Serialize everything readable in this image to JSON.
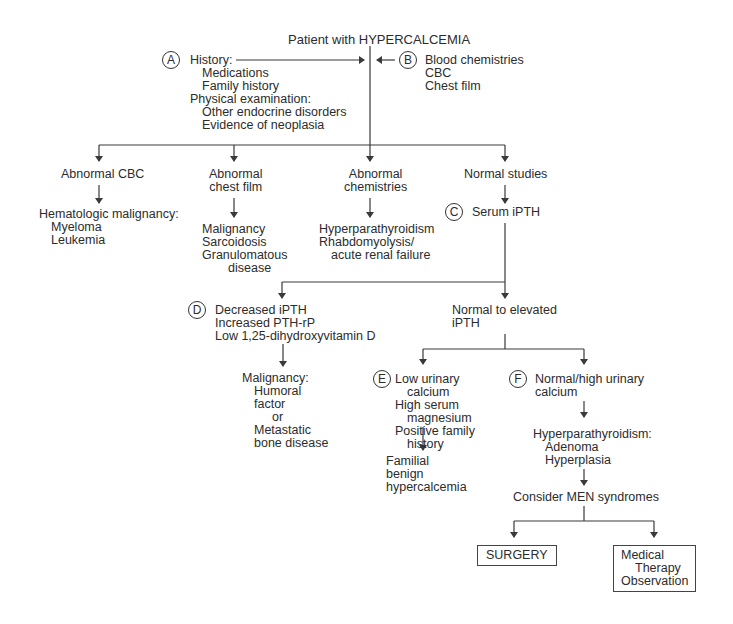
{
  "title": "Patient with HYPERCALCEMIA",
  "markers": {
    "a": "A",
    "b": "B",
    "c": "C",
    "d": "D",
    "e": "E",
    "f": "F"
  },
  "history": {
    "history_label": "History:",
    "medications": "Medications",
    "family_history": "Family history",
    "physical_label": "Physical examination:",
    "endocrine": "Other endocrine disorders",
    "neoplasia": "Evidence of neoplasia"
  },
  "tests": {
    "blood": "Blood chemistries",
    "cbc": "CBC",
    "chest": "Chest film"
  },
  "branch1": {
    "abnormal_cbc": "Abnormal CBC",
    "heme_label": "Hematologic malignancy:",
    "myeloma": "Myeloma",
    "leukemia": "Leukemia"
  },
  "branch2": {
    "line1": "Abnormal",
    "line2": "chest film",
    "malignancy": "Malignancy",
    "sarcoidosis": "Sarcoidosis",
    "granulomatous": "Granulomatous",
    "disease": "disease"
  },
  "branch3": {
    "line1": "Abnormal",
    "line2": "chemistries",
    "hyperpara": "Hyperparathyroidism",
    "rhabdo": "Rhabdomyolysis/",
    "renal": "acute renal failure"
  },
  "branch4": {
    "normal": "Normal studies",
    "serum": "Serum iPTH"
  },
  "decreased": {
    "l1": "Decreased iPTH",
    "l2": "Increased PTH-rP",
    "l3": "Low 1,25-dihydroxyvitamin D"
  },
  "malignancy2": {
    "l1": "Malignancy:",
    "l2": "Humoral",
    "l3": "factor",
    "l4": "or",
    "l5": "Metastatic",
    "l6": "bone disease"
  },
  "normal_elevated": {
    "l1": "Normal to elevated",
    "l2": "iPTH"
  },
  "low_urinary": {
    "l1": "Low urinary",
    "l2": "calcium",
    "l3": "High serum",
    "l4": "magnesium",
    "l5": "Positive family",
    "l6": "history"
  },
  "familial": {
    "l1": "Familial",
    "l2": "benign",
    "l3": "hypercalcemia"
  },
  "normal_high": {
    "l1": "Normal/high urinary",
    "l2": "calcium"
  },
  "hpt": {
    "l1": "Hyperparathyroidism:",
    "l2": "Adenoma",
    "l3": "Hyperplasia"
  },
  "men": "Consider MEN syndromes",
  "surgery": "SURGERY",
  "medical": {
    "l1": "Medical",
    "l2": "Therapy",
    "l3": "Observation"
  },
  "colors": {
    "line": "#3a3a3a",
    "text": "#2c2c2c",
    "background": "#ffffff"
  }
}
